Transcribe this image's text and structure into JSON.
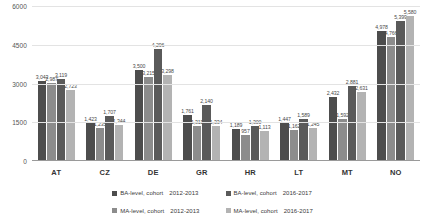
{
  "chart_data": {
    "type": "bar",
    "title": "",
    "xlabel": "",
    "ylabel": "",
    "ylim": [
      0,
      6000
    ],
    "yticks": [
      "0",
      "1500",
      "3000",
      "4500",
      "6000"
    ],
    "grid": true,
    "legend_position": "bottom",
    "categories": [
      "AT",
      "CZ",
      "DE",
      "GR",
      "HR",
      "LT",
      "MT",
      "NO"
    ],
    "series": [
      {
        "name": "BA-level, cohort",
        "period": "2012-2013",
        "color": "#4d4d4d",
        "values": [
          3043,
          1423,
          3500,
          1761,
          1189,
          1447,
          2432,
          4978
        ],
        "labels": [
          "3,043",
          "1,423",
          "3,500",
          "1,761",
          "1,189",
          "1,447",
          "2,432",
          "4,978"
        ]
      },
      {
        "name": "MA-level, cohort",
        "period": "2012-2013",
        "color": "#8c8c8c",
        "values": [
          2987,
          1235,
          3215,
          1311,
          957,
          1162,
          1592,
          4766
        ],
        "labels": [
          "2,987",
          "1,235",
          "3,215",
          "1,311",
          "957",
          "1,162",
          "1,592",
          "4,766"
        ]
      },
      {
        "name": "BA-level, cohort",
        "period": "2016-2017",
        "color": "#5a5a5a",
        "values": [
          3119,
          1707,
          4296,
          2140,
          1300,
          1589,
          2881,
          5399
        ],
        "labels": [
          "3,119",
          "1,707",
          "4,296",
          "2,140",
          "1,300",
          "1,589",
          "2,881",
          "5,399"
        ]
      },
      {
        "name": "MA-level, cohort",
        "period": "2016-2017",
        "color": "#b3b3b3",
        "values": [
          2723,
          1344,
          3298,
          1334,
          1113,
          1245,
          2631,
          5580
        ],
        "labels": [
          "2,723",
          "1,344",
          "3,298",
          "1,334",
          "1,113",
          "1,245",
          "2,631",
          "5,580"
        ]
      }
    ]
  },
  "legend": {
    "items": [
      {
        "label": "BA-level, cohort",
        "period": "2012-2013",
        "color": "#4d4d4d"
      },
      {
        "label": "BA-level, cohort",
        "period": "2016-2017",
        "color": "#5a5a5a"
      },
      {
        "label": "MA-level, cohort",
        "period": "2012-2013",
        "color": "#8c8c8c"
      },
      {
        "label": "MA-level, cohort",
        "period": "2016-2017",
        "color": "#b3b3b3"
      }
    ]
  }
}
